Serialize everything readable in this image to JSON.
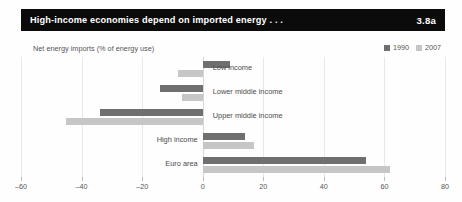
{
  "header": {
    "title": "High-income economies depend on imported energy . . .",
    "number": "3.8a",
    "background_color": "#0b0b0b",
    "text_color": "#ffffff"
  },
  "subtitle": "Net energy imports (% of energy use)",
  "legend": {
    "position": "top-right",
    "items": [
      {
        "label": "1990",
        "color": "#6f6f6f"
      },
      {
        "label": "2007",
        "color": "#c6c6c6"
      }
    ]
  },
  "chart_data": {
    "type": "bar",
    "orientation": "horizontal",
    "title": "High-income economies depend on imported energy . . .",
    "subtitle": "Net energy imports (% of energy use)",
    "xlabel": "",
    "ylabel": "",
    "xlim": [
      -60,
      80
    ],
    "xticks": [
      -60,
      -40,
      -20,
      0,
      20,
      40,
      60,
      80
    ],
    "xticklabels": [
      "–60",
      "–40",
      "–20",
      "0",
      "20",
      "40",
      "60",
      "80"
    ],
    "grid": true,
    "categories": [
      "Low income",
      "Lower middle income",
      "Upper middle income",
      "High income",
      "Euro area"
    ],
    "series": [
      {
        "name": "1990",
        "color": "#6f6f6f",
        "values": [
          9,
          -14,
          -34,
          14,
          54
        ]
      },
      {
        "name": "2007",
        "color": "#c6c6c6",
        "values": [
          -8,
          -7,
          -45,
          17,
          62
        ]
      }
    ],
    "label_placement": [
      "right-of-zero",
      "right-of-zero",
      "right-of-zero",
      "left-of-zero",
      "left-of-zero"
    ]
  }
}
